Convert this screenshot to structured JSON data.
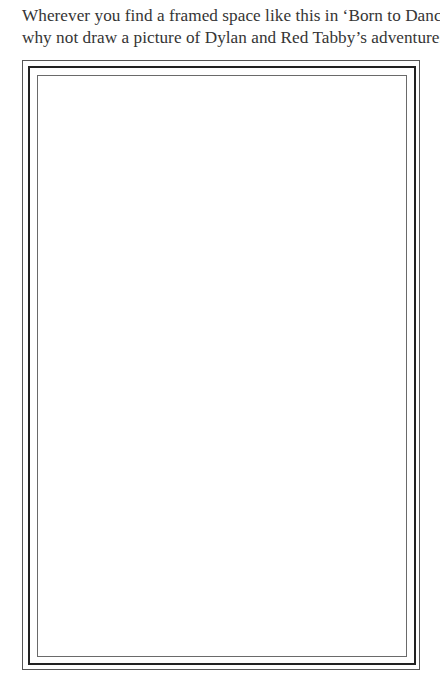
{
  "intro": {
    "line1": "Wherever you find a framed space like this in ‘Born to Dance’,",
    "line2": "why not draw a picture of Dylan and Red Tabby’s adventures?"
  },
  "frame": {
    "drawing_area_content": ""
  }
}
